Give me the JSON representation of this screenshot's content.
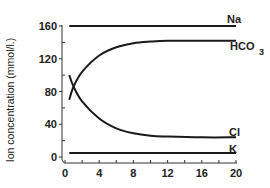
{
  "chart_data": {
    "type": "line",
    "title": "",
    "xlabel": "",
    "ylabel": "Ion concentration (mmol/l.)",
    "xlim": [
      0,
      20
    ],
    "ylim": [
      0,
      160
    ],
    "x_ticks": [
      0,
      4,
      8,
      12,
      16,
      20
    ],
    "y_ticks": [
      0,
      40,
      80,
      120,
      160
    ],
    "grid": false,
    "legend": "inline labels at right end of each line",
    "series": [
      {
        "name": "Na",
        "x": [
          0.5,
          2,
          4,
          8,
          12,
          16,
          20
        ],
        "values": [
          160,
          160,
          160,
          160,
          160,
          160,
          160
        ]
      },
      {
        "name": "HCO3",
        "x": [
          0.5,
          1,
          2,
          4,
          6,
          8,
          10,
          12,
          16,
          20
        ],
        "values": [
          70,
          86,
          104,
          124,
          134,
          139,
          141,
          142,
          142,
          142
        ]
      },
      {
        "name": "Cl",
        "x": [
          0.5,
          1,
          2,
          4,
          6,
          8,
          10,
          12,
          16,
          20
        ],
        "values": [
          100,
          86,
          68,
          47,
          35,
          29,
          26,
          25,
          24,
          24
        ]
      },
      {
        "name": "K",
        "x": [
          0.5,
          2,
          4,
          8,
          12,
          16,
          20
        ],
        "values": [
          5,
          5,
          5,
          5,
          5,
          5,
          5
        ]
      }
    ],
    "annotations": [
      "Na",
      "HCO3",
      "Cl",
      "K"
    ]
  },
  "labels": {
    "ylabel": "Ion concentration (mmol/l.)",
    "na": "Na",
    "hco3_main": "HCO",
    "hco3_sub": "3",
    "cl": "Cl",
    "k": "K"
  },
  "colors": {
    "line": "#1a1a1a",
    "axis": "#333333",
    "text": "#222222"
  }
}
